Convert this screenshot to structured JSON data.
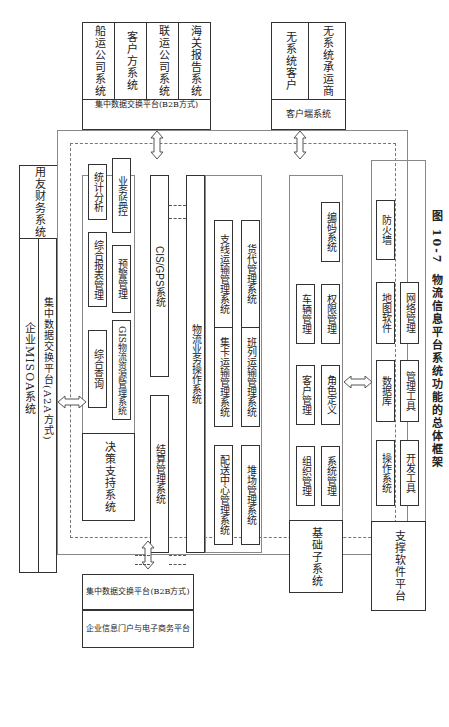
{
  "figure": {
    "caption_number": "图 10-7",
    "caption_title": "物流信息平台系统功能的总体框架"
  },
  "external_top": {
    "systems": [
      "船运公司系统",
      "客户方系统",
      "联运公司系统",
      "海关报告系统"
    ],
    "exchange": "集中数据交换平台(B2B方式)"
  },
  "external_client": {
    "systems": [
      "无系统客户",
      "无系统承运商"
    ],
    "label": "客户端系统"
  },
  "external_left": {
    "misoa": "企业MISOA系统",
    "finance": "用友财务系统",
    "a2a_exchange": "集中数据交换平台(A2A方式)"
  },
  "external_bottom": {
    "exchange": "集中数据交换平台(B2B方式)",
    "portal": "企业信息门户与电子商务平台"
  },
  "decision": {
    "title": "决策支持系统",
    "modules": [
      "综合查询",
      "GIS物流资源管理系统",
      "综合报表管理",
      "预警管理",
      "统计分析",
      "业务监控"
    ]
  },
  "settlement": "结算管理系统",
  "gps": "CIS/GPS系统",
  "operations": {
    "title": "物流业务操作系统",
    "modules": [
      "配送中心管理系统",
      "堆场管理系统",
      "集卡运输管理系统",
      "班列运输管理系统",
      "支线运输管理系统",
      "货代管理系统"
    ]
  },
  "base": {
    "title": "基础子系统",
    "modules": [
      "组织管理",
      "系统管理",
      "客户管理",
      "角色定义",
      "车辆管理",
      "权限管理",
      "编码系统"
    ]
  },
  "support": {
    "title": "支撑软件平台",
    "modules": [
      "操作系统",
      "开发工具",
      "数据库",
      "管理工具",
      "地图软件",
      "网络管理",
      "防火墙"
    ]
  }
}
